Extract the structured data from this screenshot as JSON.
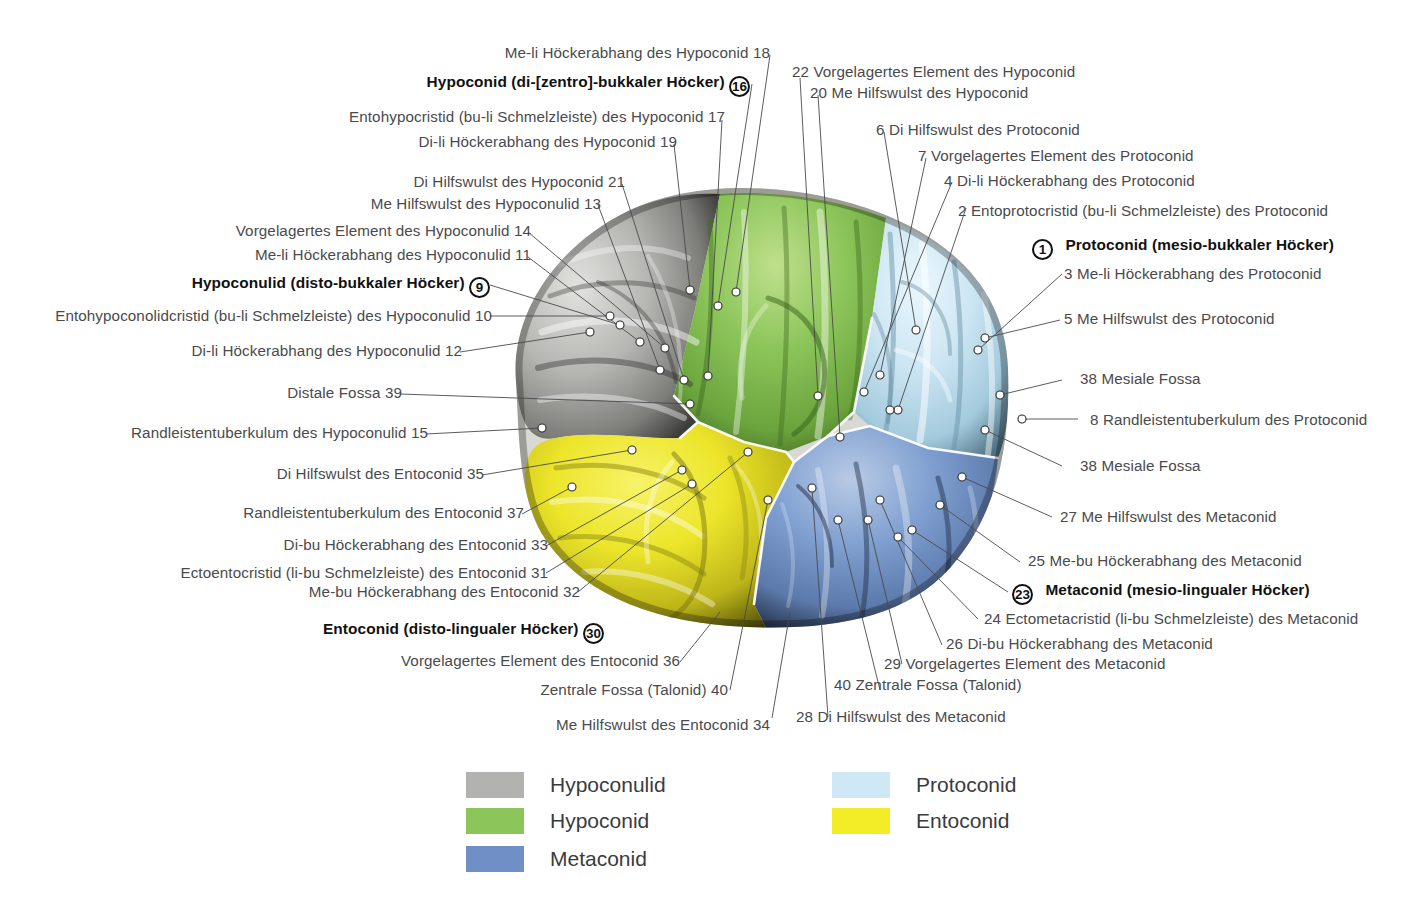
{
  "figure": {
    "colors": {
      "hypoconulid": "#b2b2ae",
      "hypoconid": "#8cc55a",
      "metaconid": "#6f8fc6",
      "protoconid": "#cfe8f5",
      "entoconid": "#f3ed27",
      "leader": "#4a4a4c",
      "dot_fill": "#ffffff",
      "dot_stroke": "#2b2b2b",
      "text": "#4a4a4c",
      "bold_text": "#111111"
    }
  },
  "labels": {
    "left": [
      {
        "id": "l18",
        "num": "18",
        "text": "Me-li Höckerabhang des Hypoconid",
        "bold": false,
        "badge": false
      },
      {
        "id": "l16",
        "num": "16",
        "text": "Hypoconid (di-[zentro]-bukkaler Höcker)",
        "bold": true,
        "badge": true
      },
      {
        "id": "l17",
        "num": "17",
        "text": "Entohypocristid (bu-li Schmelzleiste) des Hypoconid",
        "bold": false,
        "badge": false
      },
      {
        "id": "l19",
        "num": "19",
        "text": "Di-li Höckerabhang des Hypoconid",
        "bold": false,
        "badge": false
      },
      {
        "id": "l21",
        "num": "21",
        "text": "Di Hilfswulst des Hypoconid",
        "bold": false,
        "badge": false
      },
      {
        "id": "l13",
        "num": "13",
        "text": "Me Hilfswulst des Hypoconulid",
        "bold": false,
        "badge": false
      },
      {
        "id": "l14",
        "num": "14",
        "text": "Vorgelagertes Element des Hypoconulid",
        "bold": false,
        "badge": false
      },
      {
        "id": "l11",
        "num": "11",
        "text": "Me-li Höckerabhang des Hypoconulid",
        "bold": false,
        "badge": false
      },
      {
        "id": "l9",
        "num": "9",
        "text": "Hypoconulid (disto-bukkaler Höcker)",
        "bold": true,
        "badge": true
      },
      {
        "id": "l10",
        "num": "10",
        "text": "Entohypoconolidcristid (bu-li Schmelzleiste) des Hypoconulid",
        "bold": false,
        "badge": false
      },
      {
        "id": "l12",
        "num": "12",
        "text": "Di-li Höckerabhang des Hypoconulid",
        "bold": false,
        "badge": false
      },
      {
        "id": "l39",
        "num": "39",
        "text": "Distale Fossa",
        "bold": false,
        "badge": false
      },
      {
        "id": "l15",
        "num": "15",
        "text": "Randleistentuberkulum des Hypoconulid",
        "bold": false,
        "badge": false
      },
      {
        "id": "l35",
        "num": "35",
        "text": "Di Hilfswulst des Entoconid",
        "bold": false,
        "badge": false
      },
      {
        "id": "l37",
        "num": "37",
        "text": "Randleistentuberkulum des Entoconid",
        "bold": false,
        "badge": false
      },
      {
        "id": "l33",
        "num": "33",
        "text": "Di-bu Höckerabhang des Entoconid",
        "bold": false,
        "badge": false
      },
      {
        "id": "l31",
        "num": "31",
        "text": "Ectoentocristid (li-bu Schmelzleiste) des Entoconid",
        "bold": false,
        "badge": false
      },
      {
        "id": "l32",
        "num": "32",
        "text": "Me-bu Höckerabhang des Entoconid",
        "bold": false,
        "badge": false
      },
      {
        "id": "l30",
        "num": "30",
        "text": "Entoconid (disto-lingualer Höcker)",
        "bold": true,
        "badge": true
      },
      {
        "id": "l36",
        "num": "36",
        "text": "Vorgelagertes Element des Entoconid",
        "bold": false,
        "badge": false
      },
      {
        "id": "l40a",
        "num": "40",
        "text": "Zentrale Fossa (Talonid)",
        "bold": false,
        "badge": false
      },
      {
        "id": "l34",
        "num": "34",
        "text": "Me Hilfswulst des Entoconid",
        "bold": false,
        "badge": false
      }
    ],
    "right": [
      {
        "id": "r22",
        "num": "22",
        "text": "Vorgelagertes Element des Hypoconid",
        "bold": false,
        "badge": false
      },
      {
        "id": "r20",
        "num": "20",
        "text": "Me Hilfswulst des Hypoconid",
        "bold": false,
        "badge": false
      },
      {
        "id": "r6",
        "num": "6",
        "text": "Di Hilfswulst des Protoconid",
        "bold": false,
        "badge": false
      },
      {
        "id": "r7",
        "num": "7",
        "text": "Vorgelagertes Element des Protoconid",
        "bold": false,
        "badge": false
      },
      {
        "id": "r4",
        "num": "4",
        "text": "Di-li Höckerabhang des Protoconid",
        "bold": false,
        "badge": false
      },
      {
        "id": "r2",
        "num": "2",
        "text": "Entoprotocristid (bu-li Schmelzleiste) des Protoconid",
        "bold": false,
        "badge": false
      },
      {
        "id": "r1",
        "num": "1",
        "text": "Protoconid (mesio-bukkaler Höcker)",
        "bold": true,
        "badge": true
      },
      {
        "id": "r3",
        "num": "3",
        "text": "Me-li Höckerabhang des Protoconid",
        "bold": false,
        "badge": false
      },
      {
        "id": "r5",
        "num": "5",
        "text": "Me Hilfswulst des Protoconid",
        "bold": false,
        "badge": false
      },
      {
        "id": "r38a",
        "num": "38",
        "text": "Mesiale Fossa",
        "bold": false,
        "badge": false
      },
      {
        "id": "r8",
        "num": "8",
        "text": "Randleistentuberkulum des Protoconid",
        "bold": false,
        "badge": false
      },
      {
        "id": "r38b",
        "num": "38",
        "text": "Mesiale Fossa",
        "bold": false,
        "badge": false
      },
      {
        "id": "r27",
        "num": "27",
        "text": "Me Hilfswulst des Metaconid",
        "bold": false,
        "badge": false
      },
      {
        "id": "r25",
        "num": "25",
        "text": "Me-bu Höckerabhang des Metaconid",
        "bold": false,
        "badge": false
      },
      {
        "id": "r23",
        "num": "23",
        "text": "Metaconid (mesio-lingualer Höcker)",
        "bold": true,
        "badge": true
      },
      {
        "id": "r24",
        "num": "24",
        "text": "Ectometacristid (li-bu Schmelzleiste) des Metaconid",
        "bold": false,
        "badge": false
      },
      {
        "id": "r26",
        "num": "26",
        "text": "Di-bu Höckerabhang des Metaconid",
        "bold": false,
        "badge": false
      },
      {
        "id": "r29",
        "num": "29",
        "text": "Vorgelagertes Element des Metaconid",
        "bold": false,
        "badge": false
      },
      {
        "id": "r40b",
        "num": "40",
        "text": "Zentrale Fossa (Talonid)",
        "bold": false,
        "badge": false
      },
      {
        "id": "r28",
        "num": "28",
        "text": "Di Hilfswulst des Metaconid",
        "bold": false,
        "badge": false
      }
    ]
  },
  "legend": {
    "items": [
      {
        "id": "leg-hypoconulid",
        "label": "Hypoconulid",
        "color": "#b2b2ae"
      },
      {
        "id": "leg-hypoconid",
        "label": "Hypoconid",
        "color": "#8cc55a"
      },
      {
        "id": "leg-metaconid",
        "label": "Metaconid",
        "color": "#6f8fc6"
      },
      {
        "id": "leg-protoconid",
        "label": "Protoconid",
        "color": "#cfe8f5"
      },
      {
        "id": "leg-entoconid",
        "label": "Entoconid",
        "color": "#f3ed27"
      }
    ]
  }
}
